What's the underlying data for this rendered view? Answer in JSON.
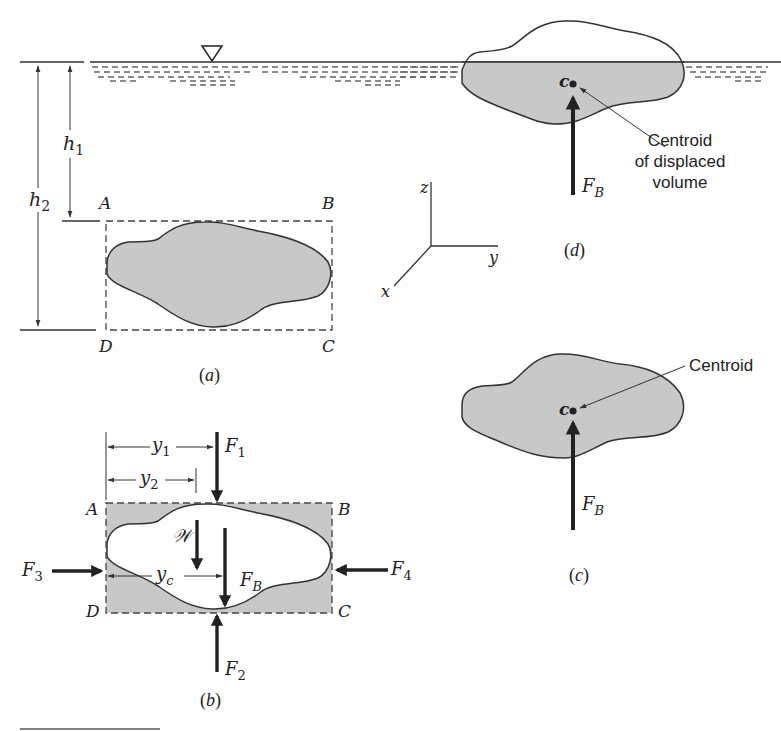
{
  "figure": {
    "panels": {
      "a": {
        "caption": "(a)",
        "corner_labels": {
          "A": "A",
          "B": "B",
          "C": "C",
          "D": "D"
        },
        "dimensions": {
          "h1": "h",
          "h1_sub": "1",
          "h2": "h",
          "h2_sub": "2"
        },
        "free_surface_symbol": "free-surface-triangle"
      },
      "b": {
        "caption": "(b)",
        "corner_labels": {
          "A": "A",
          "B": "B",
          "C": "C",
          "D": "D"
        },
        "forces": {
          "F1": {
            "main": "F",
            "sub": "1"
          },
          "F2": {
            "main": "F",
            "sub": "2"
          },
          "F3": {
            "main": "F",
            "sub": "3"
          },
          "F4": {
            "main": "F",
            "sub": "4"
          },
          "FB": {
            "main": "F",
            "sub": "B"
          },
          "W": "𝒲"
        },
        "distances": {
          "y1": {
            "main": "y",
            "sub": "1"
          },
          "y2": {
            "main": "y",
            "sub": "2"
          },
          "yc": {
            "main": "y",
            "sub": "c"
          }
        }
      },
      "c": {
        "caption": "(c)",
        "centroid_point": "c",
        "centroid_label": "Centroid",
        "force": {
          "main": "F",
          "sub": "B"
        }
      },
      "d": {
        "caption": "(d)",
        "centroid_point": "c",
        "centroid_label_lines": [
          "Centroid",
          "of displaced",
          "volume"
        ],
        "force": {
          "main": "F",
          "sub": "B"
        }
      }
    },
    "axes": {
      "z": "z",
      "y": "y",
      "x": "x"
    },
    "colors": {
      "ink": "#222222",
      "body_fill": "#c8c8c8",
      "water_dash": "#555555"
    }
  }
}
